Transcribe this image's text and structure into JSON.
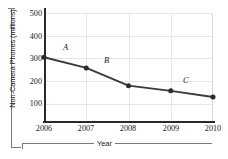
{
  "chart_data": {
    "type": "line",
    "title": "",
    "xlabel": "Year",
    "ylabel": "Non-Camera Phones (millions)",
    "categories": [
      "2006",
      "2007",
      "2008",
      "2009",
      "2010"
    ],
    "x": [
      2006,
      2007,
      2008,
      2009,
      2010
    ],
    "values": [
      305,
      258,
      180,
      157,
      130
    ],
    "series": [
      {
        "name": "Non-Camera Phones",
        "values": [
          305,
          258,
          180,
          157,
          130
        ]
      }
    ],
    "xlim": [
      2006,
      2010
    ],
    "ylim": [
      0,
      500
    ],
    "yticks": [
      "100",
      "200",
      "300",
      "400",
      "500"
    ],
    "ytick_values": [
      100,
      200,
      300,
      400,
      500
    ],
    "xticks": [
      "2006",
      "2007",
      "2008",
      "2009",
      "2010"
    ],
    "grid": true,
    "legend": "none",
    "marker": "filled-circle",
    "line_color": "#3a3a3a",
    "marker_color": "#2b2b2b",
    "grid_color": "#e6e6e6",
    "annotations": [
      {
        "label": "A",
        "between": [
          "2006",
          "2007"
        ]
      },
      {
        "label": "B",
        "between": [
          "2007",
          "2008"
        ]
      },
      {
        "label": "C",
        "between": [
          "2009",
          "2010"
        ]
      }
    ]
  }
}
